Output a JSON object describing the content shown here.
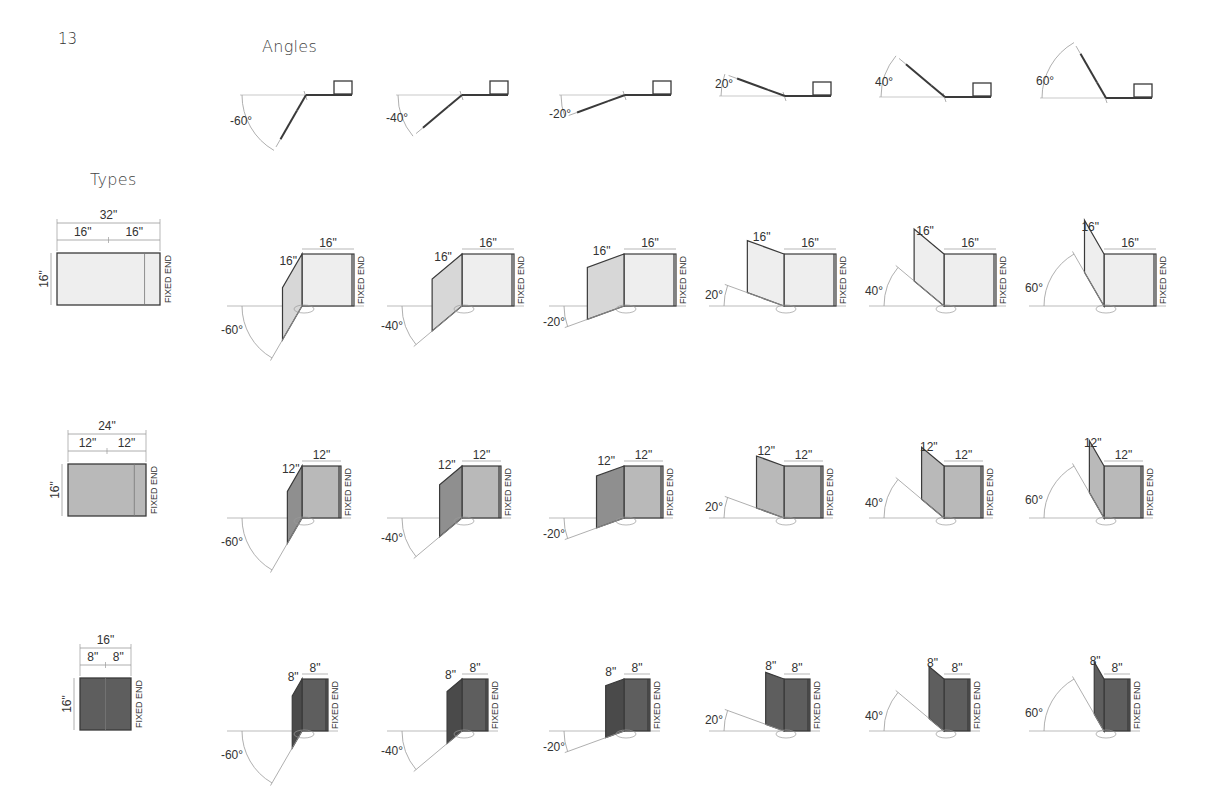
{
  "page": {
    "number": "13"
  },
  "sections": {
    "angles_title": "Angles",
    "types_title": "Types"
  },
  "fixed_end_label": "FIXED END",
  "colors": {
    "type_1_fill": "#eeeeee",
    "type_1_fold_fill": "#d7d7d7",
    "type_2_fill": "#b9b9b9",
    "type_2_fold_fill": "#8f8f8f",
    "type_3_fill": "#5e5e5e",
    "type_3_fold_fill": "#4a4a4a",
    "line": "#3a3a3a",
    "guide": "#9a9a9a"
  },
  "angles": [
    {
      "label": "-60°",
      "value": -60,
      "cx": 306,
      "cy": 95
    },
    {
      "label": "-40°",
      "value": -40,
      "cx": 462,
      "cy": 95
    },
    {
      "label": "-20°",
      "value": -20,
      "cx": 625,
      "cy": 95
    },
    {
      "label": "20°",
      "value": 20,
      "cx": 785,
      "cy": 96
    },
    {
      "label": "40°",
      "value": 40,
      "cx": 945,
      "cy": 97
    },
    {
      "label": "60°",
      "value": 60,
      "cx": 1106,
      "cy": 98
    }
  ],
  "types": [
    {
      "id": "type-1",
      "overall_width": "32\"",
      "segment_width_1": "16\"",
      "segment_width_2": "16\"",
      "height": "16\"",
      "plan": {
        "x": 57,
        "y": 253,
        "w": 103,
        "h": 52
      },
      "row_baseline": 306,
      "panel_px": 52,
      "height_px": 52,
      "fold_label": "16\"",
      "fixed_label": "16\"",
      "fill_key": "type_1_fill",
      "fold_fill_key": "type_1_fold_fill"
    },
    {
      "id": "type-2",
      "overall_width": "24\"",
      "segment_width_1": "12\"",
      "segment_width_2": "12\"",
      "height": "16\"",
      "plan": {
        "x": 68,
        "y": 464,
        "w": 78,
        "h": 52
      },
      "row_baseline": 518,
      "panel_px": 39,
      "height_px": 52,
      "fold_label": "12\"",
      "fixed_label": "12\"",
      "fill_key": "type_2_fill",
      "fold_fill_key": "type_2_fold_fill"
    },
    {
      "id": "type-3",
      "overall_width": "16\"",
      "segment_width_1": "8\"",
      "segment_width_2": "8\"",
      "height": "16\"",
      "plan": {
        "x": 80,
        "y": 678,
        "w": 51,
        "h": 52
      },
      "row_baseline": 731,
      "panel_px": 26,
      "height_px": 52,
      "fold_label": "8\"",
      "fixed_label": "8\"",
      "fill_key": "type_3_fill",
      "fold_fill_key": "type_3_fold_fill"
    }
  ],
  "row_hinge_x": [
    302,
    462,
    624,
    784,
    944,
    1104
  ]
}
